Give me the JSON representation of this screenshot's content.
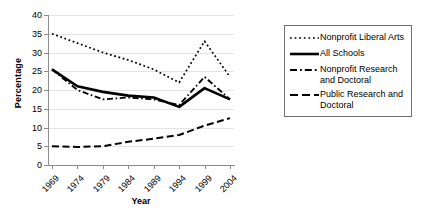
{
  "chart_data": {
    "type": "line",
    "title": "",
    "xlabel": "Year",
    "ylabel": "Percentage",
    "categories": [
      "1969",
      "1974",
      "1979",
      "1984",
      "1989",
      "1994",
      "1999",
      "2004"
    ],
    "x": [
      1969,
      1974,
      1979,
      1984,
      1989,
      1994,
      1999,
      2004
    ],
    "ylim": [
      0,
      40
    ],
    "yticks": [
      "0",
      "5",
      "10",
      "15",
      "20",
      "25",
      "30",
      "35",
      "40"
    ],
    "ytick_values": [
      0,
      5,
      10,
      15,
      20,
      25,
      30,
      35,
      40
    ],
    "grid": "horizontal",
    "legend_position": "right",
    "series": [
      {
        "name": "Nonprofit Liberal Arts",
        "style": "dotted",
        "color": "#000000",
        "values": [
          35,
          32.5,
          30,
          28,
          25.5,
          22,
          33,
          23.5
        ]
      },
      {
        "name": "All Schools",
        "style": "solid",
        "color": "#000000",
        "values": [
          25.5,
          21,
          19.5,
          18.5,
          18,
          15.5,
          20.5,
          17.5
        ]
      },
      {
        "name": "Nonprofit Research and Doctoral",
        "style": "dash-dot",
        "color": "#000000",
        "values": [
          25.5,
          20,
          17.5,
          18,
          17.5,
          16,
          23.5,
          17.5
        ]
      },
      {
        "name": "Public Research and Doctoral",
        "style": "dashed",
        "color": "#000000",
        "values": [
          5,
          4.8,
          5,
          6.2,
          7,
          8,
          10.5,
          12.5
        ]
      }
    ]
  },
  "legend": {
    "entries": [
      {
        "label": "Nonprofit Liberal Arts"
      },
      {
        "label": "All Schools"
      },
      {
        "label": "Nonprofit Research and Doctoral"
      },
      {
        "label": "Public Research and Doctoral"
      }
    ]
  }
}
